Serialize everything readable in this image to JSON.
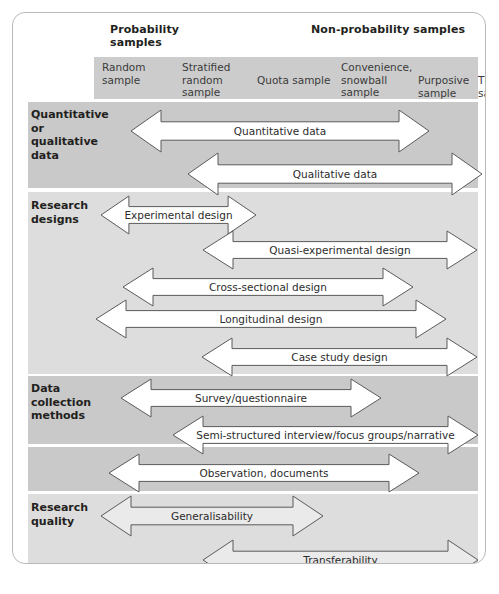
{
  "figure": {
    "groups": [
      {
        "id": "probability",
        "label": "Probability\nsamples"
      },
      {
        "id": "non-probability",
        "label": "Non-probability samples"
      }
    ],
    "columns": [
      {
        "id": "random-sample",
        "label": "Random\nsample",
        "x": 8,
        "w": 80
      },
      {
        "id": "stratified-sample",
        "label": "Stratified\nrandom\nsample",
        "x": 88,
        "w": 78
      },
      {
        "id": "quota-sample",
        "label": "Quota sample",
        "x": 163,
        "w": 82
      },
      {
        "id": "convenience-sample",
        "label": "Convenience,\nsnowball\nsample",
        "x": 207,
        "w": 78
      },
      {
        "id": "purposive-sample",
        "label": "Purposive\nsample",
        "x": 285,
        "w": 62
      },
      {
        "id": "theoretical-sample",
        "label": "Theoretical\nsample",
        "x": 345,
        "w": 70
      }
    ],
    "sections": [
      {
        "id": "data-type",
        "label": "Quantitative\nor\nqualitative\ndata"
      },
      {
        "id": "research-designs",
        "label": "Research\ndesigns"
      },
      {
        "id": "data-collection",
        "label": "Data\ncollection\nmethods"
      },
      {
        "id": "research-quality",
        "label": "Research\nquality"
      }
    ],
    "arrows": [
      {
        "id": "quantitative-data",
        "label": "Quantitative data",
        "left": 118,
        "width": 298,
        "top": 97,
        "height": 42,
        "fill": "#ffffff"
      },
      {
        "id": "qualitative-data",
        "label": "Qualitative data",
        "left": 175,
        "width": 294,
        "top": 140,
        "height": 42,
        "fill": "#ffffff"
      },
      {
        "id": "experimental-design",
        "label": "Experimental design",
        "left": 88,
        "width": 155,
        "top": 183,
        "height": 38,
        "fill": "#ffffff"
      },
      {
        "id": "quasi-experimental-design",
        "label": "Quasi-experimental design",
        "left": 190,
        "width": 274,
        "top": 218,
        "height": 38,
        "fill": "#ffffff"
      },
      {
        "id": "cross-sectional-design",
        "label": "Cross-sectional design",
        "left": 110,
        "width": 290,
        "top": 255,
        "height": 38,
        "fill": "#ffffff"
      },
      {
        "id": "longitudinal-design",
        "label": "Longitudinal design",
        "left": 83,
        "width": 350,
        "top": 287,
        "height": 38,
        "fill": "#ffffff"
      },
      {
        "id": "case-study-design",
        "label": "Case study design",
        "left": 189,
        "width": 275,
        "top": 325,
        "height": 38,
        "fill": "#ffffff"
      },
      {
        "id": "survey-questionnaire",
        "label": "Survey/questionnaire",
        "left": 108,
        "width": 260,
        "top": 366,
        "height": 38,
        "fill": "#ffffff"
      },
      {
        "id": "semi-structured-interview",
        "label": "Semi-structured interview/focus groups/narrative",
        "left": 160,
        "width": 305,
        "top": 403,
        "height": 38,
        "fill": "#ffffff"
      },
      {
        "id": "observation-documents",
        "label": "Observation, documents",
        "left": 96,
        "width": 310,
        "top": 441,
        "height": 38,
        "fill": "#ffffff"
      },
      {
        "id": "generalisability",
        "label": "Generalisability",
        "left": 88,
        "width": 222,
        "top": 483,
        "height": 40,
        "fill": "#eaeaea"
      },
      {
        "id": "transferability",
        "label": "Transferability",
        "left": 190,
        "width": 275,
        "top": 527,
        "height": 40,
        "fill": "#eaeaea"
      }
    ]
  }
}
